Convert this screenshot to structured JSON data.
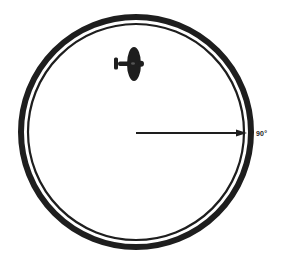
{
  "diagram": {
    "circle": {
      "cx": 136,
      "cy": 132,
      "outer_r": 115,
      "inner_r": 108,
      "color": "#1e1e1e"
    },
    "arrow": {
      "from_x": 136,
      "to_x": 246,
      "y": 133,
      "color": "#1e1e1e"
    },
    "heading_label": "90°",
    "aircraft": {
      "x": 128,
      "y": 64,
      "orientation": "nose-up"
    }
  }
}
